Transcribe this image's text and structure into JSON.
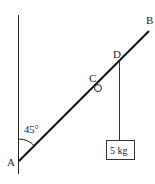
{
  "diagram": {
    "labels": {
      "A": "A",
      "B": "B",
      "C": "C",
      "D": "D",
      "angle": "45°",
      "mass": "5 kg"
    },
    "colors": {
      "line": "#111111",
      "background": "#ffffff"
    }
  }
}
